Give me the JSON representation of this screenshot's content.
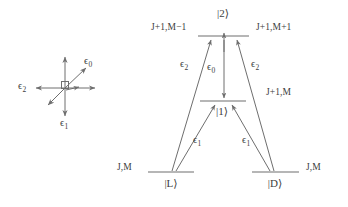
{
  "figure": {
    "type": "energy-level-diagram",
    "background_color": "#ffffff",
    "stroke_color": "#6e6e6e",
    "text_color": "#404040",
    "width": 348,
    "height": 207
  },
  "polarization_inset": {
    "name": "polarization-axes",
    "origin": {
      "x": 65,
      "y": 88
    },
    "square_marker": {
      "x": 65,
      "y": 88,
      "size": 7
    },
    "vectors": [
      {
        "id": "eps0",
        "label": "ϵ",
        "subscript": "0",
        "direction": "up-right-diagonal",
        "label_x": 88,
        "label_y": 62
      },
      {
        "id": "eps1",
        "label": "ϵ",
        "subscript": "1",
        "direction": "down",
        "label_x": 64,
        "label_y": 122
      },
      {
        "id": "eps2",
        "label": "ϵ",
        "subscript": "2",
        "direction": "left",
        "label_x": 22,
        "label_y": 84
      }
    ],
    "unlabeled_arrows": [
      "up",
      "right",
      "down-left-diagonal"
    ]
  },
  "levels": [
    {
      "id": "level-2",
      "ket": "|2⟩",
      "ket_x": 223,
      "ket_y": 12,
      "line": {
        "x1": 198,
        "x2": 249,
        "y": 36
      },
      "label_left": "J+1,M−1",
      "label_left_x": 190,
      "label_left_y": 27,
      "label_right": "J+1,M+1",
      "label_right_x": 258,
      "label_right_y": 27
    },
    {
      "id": "level-1",
      "ket": "|1⟩",
      "ket_x": 222,
      "ket_y": 110,
      "line": {
        "x1": 200,
        "x2": 246,
        "y": 101
      },
      "label_right": "J+1,M",
      "label_right_x": 268,
      "label_right_y": 92
    },
    {
      "id": "level-L",
      "ket": "|L⟩",
      "ket_x": 171,
      "ket_y": 182,
      "line": {
        "x1": 148,
        "x2": 194,
        "y": 172
      },
      "label_left": "J,M",
      "label_left_x": 140,
      "label_left_y": 166
    },
    {
      "id": "level-D",
      "ket": "|D⟩",
      "ket_x": 275,
      "ket_y": 182,
      "line": {
        "x1": 252,
        "x2": 299,
        "y": 172
      },
      "label_right": "J,M",
      "label_right_x": 308,
      "label_right_y": 166
    }
  ],
  "transitions": [
    {
      "id": "L-to-2",
      "label": "ϵ",
      "subscript": "2",
      "label_x": 184,
      "label_y": 63,
      "from": "level-L",
      "to": "level-2"
    },
    {
      "id": "D-to-2",
      "label": "ϵ",
      "subscript": "2",
      "label_x": 253,
      "label_y": 63,
      "from": "level-D",
      "to": "level-2"
    },
    {
      "id": "2-to-1",
      "label": "ϵ",
      "subscript": "0",
      "label_x": 211,
      "label_y": 66,
      "from": "level-2",
      "to": "level-1"
    },
    {
      "id": "L-to-1",
      "label": "ϵ",
      "subscript": "1",
      "label_x": 196,
      "label_y": 139,
      "from": "level-L",
      "to": "level-1"
    },
    {
      "id": "D-to-1",
      "label": "ϵ",
      "subscript": "1",
      "label_x": 245,
      "label_y": 139,
      "from": "level-D",
      "to": "level-1"
    }
  ]
}
